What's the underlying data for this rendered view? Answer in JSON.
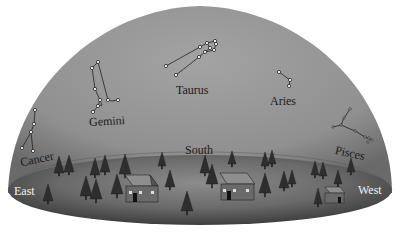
{
  "diagram": {
    "type": "celestial-dome",
    "colors": {
      "sky_light": "#9a9a9a",
      "sky_dark": "#6e6e6e",
      "ground_light": "#8a8a8a",
      "ground_dark": "#4a4a4a",
      "line": "#222222",
      "star_fill": "#ffffff"
    },
    "constellations": [
      {
        "name": "Taurus",
        "label": "Taurus"
      },
      {
        "name": "Gemini",
        "label": "Gemini"
      },
      {
        "name": "Cancer",
        "label": "Cancer"
      },
      {
        "name": "Aries",
        "label": "Aries"
      },
      {
        "name": "Pisces",
        "label": "Pisces"
      }
    ],
    "directions": {
      "east": "East",
      "south": "South",
      "west": "West"
    }
  }
}
